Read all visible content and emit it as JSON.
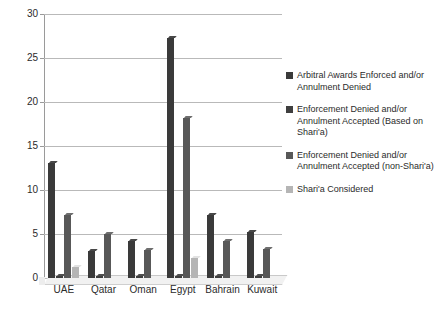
{
  "chart_data": {
    "type": "bar",
    "title": "",
    "subtitle": "",
    "xlabel": "",
    "ylabel": "",
    "grid": true,
    "legend_position": "right",
    "ylim": [
      0,
      30
    ],
    "yticks": [
      "0",
      "5",
      "10",
      "15",
      "20",
      "25",
      "30"
    ],
    "ytick_values": [
      0,
      5,
      10,
      15,
      20,
      25,
      30
    ],
    "categories": [
      "UAE",
      "Qatar",
      "Oman",
      "Egypt",
      "Bahrain",
      "Kuwait"
    ],
    "series": [
      {
        "name": "Arbitral Awards Enforced and/or Annulment Denied",
        "color": "#3a3a3a",
        "values": [
          13.1,
          3.1,
          4.2,
          27.3,
          7.2,
          5.2
        ]
      },
      {
        "name": "Enforcement Denied and/or Annulment Accepted (Based on Shari'a)",
        "color": "#3f3f3f",
        "values": [
          0.2,
          0.2,
          0.2,
          0.2,
          0.2,
          0.2
        ]
      },
      {
        "name": "Enforcement Denied and/or Annulment Accepted (non-Shari'a)",
        "color": "#585858",
        "values": [
          7.2,
          5.0,
          3.2,
          18.2,
          4.2,
          3.3
        ]
      },
      {
        "name": "Shari'a Considered",
        "color": "#b5b5b5",
        "values": [
          1.2,
          0,
          0,
          2.3,
          0,
          0
        ]
      }
    ]
  },
  "legend": {
    "items": [
      {
        "label": "Arbitral Awards Enforced and/or Annulment Denied",
        "color": "#3a3a3a"
      },
      {
        "label": "Enforcement Denied and/or Annulment Accepted (Based on Shari'a)",
        "color": "#3f3f3f"
      },
      {
        "label": "Enforcement Denied and/or Annulment Accepted (non-Shari'a)",
        "color": "#585858"
      },
      {
        "label": "Shari'a Considered",
        "color": "#b5b5b5"
      }
    ]
  },
  "colors": {
    "background": "#ffffff",
    "gridline": "#b9b9b9",
    "axis": "#9a9a9a",
    "text": "#2b2b2b",
    "floor": "#f1f1f1"
  }
}
